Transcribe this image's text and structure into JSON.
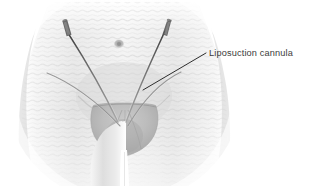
{
  "figure": {
    "background_color": "#ffffff",
    "style": "grayscale medical illustration",
    "width": 318,
    "height": 186
  },
  "annotation": {
    "label": "Liposuction cannula",
    "text_color": "#3b3b3b",
    "leader_line_color": "#2e2e2e",
    "leader_start_x": 143,
    "leader_start_y": 90,
    "leader_end_x": 206,
    "leader_end_y": 53,
    "text_x": 209,
    "text_y": 56
  },
  "anatomy": {
    "region_name": "lower abdomen and pelvis",
    "skin_tone": "#e9e9e9",
    "shadow_tone": "#bcbcbc",
    "parts": [
      {
        "name": "torso",
        "label": "Lower abdomen"
      },
      {
        "name": "navel",
        "label": "Umbilicus"
      },
      {
        "name": "mons-pubis",
        "label": "Mons pubis"
      },
      {
        "name": "left-thigh",
        "label": "Left thigh"
      },
      {
        "name": "right-thigh",
        "label": "Right thigh"
      },
      {
        "name": "skin-ripple-texture",
        "label": "Skin contour ripples"
      }
    ]
  },
  "instruments": [
    {
      "name": "left-cannula",
      "label": "Liposuction cannula (left)",
      "entry_x": 66,
      "entry_y": 28,
      "tip_x": 117,
      "tip_y": 122,
      "color": "#6d6d6d",
      "handle_color": "#555555"
    },
    {
      "name": "right-cannula",
      "label": "Liposuction cannula (right)",
      "entry_x": 167,
      "entry_y": 26,
      "tip_x": 124,
      "tip_y": 122,
      "color": "#6d6d6d",
      "handle_color": "#555555"
    },
    {
      "name": "left-secondary-cannula",
      "label": "Cannula sweep path (left)",
      "entry_x": 47,
      "entry_y": 73,
      "tip_x": 122,
      "tip_y": 125,
      "color": "#8a8a8a",
      "handle_color": "#8a8a8a"
    },
    {
      "name": "right-secondary-cannula",
      "label": "Cannula sweep path (right)",
      "entry_x": 180,
      "entry_y": 72,
      "tip_x": 126,
      "tip_y": 125,
      "color": "#8a8a8a",
      "handle_color": "#8a8a8a"
    }
  ]
}
